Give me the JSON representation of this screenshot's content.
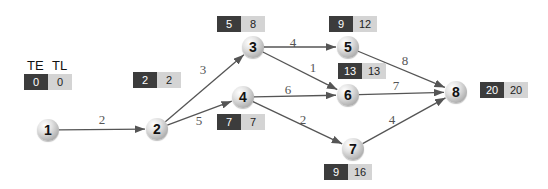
{
  "legend": {
    "te_label": "TE",
    "tl_label": "TL"
  },
  "colors": {
    "te_box": "#3c3c3c",
    "tl_box": "#d4d4d4",
    "edge": "#555555"
  },
  "nodes": [
    {
      "id": "1",
      "x": 48,
      "y": 130,
      "te": "0",
      "tl": "0",
      "bx": 24,
      "by": 74
    },
    {
      "id": "2",
      "x": 157,
      "y": 129,
      "te": "2",
      "tl": "2",
      "bx": 133,
      "by": 72
    },
    {
      "id": "3",
      "x": 253,
      "y": 47,
      "te": "5",
      "tl": "8",
      "bx": 217,
      "by": 16
    },
    {
      "id": "4",
      "x": 243,
      "y": 97,
      "te": "7",
      "tl": "7",
      "bx": 217,
      "by": 114
    },
    {
      "id": "5",
      "x": 348,
      "y": 47,
      "te": "9",
      "tl": "12",
      "bx": 329,
      "by": 16
    },
    {
      "id": "6",
      "x": 348,
      "y": 95,
      "te": "13",
      "tl": "13",
      "bx": 338,
      "by": 63
    },
    {
      "id": "7",
      "x": 353,
      "y": 149,
      "te": "9",
      "tl": "16",
      "bx": 324,
      "by": 164
    },
    {
      "id": "8",
      "x": 456,
      "y": 92,
      "te": "20",
      "tl": "20",
      "bx": 480,
      "by": 82
    }
  ],
  "edges": [
    {
      "from": "1",
      "to": "2",
      "weight": "2",
      "lx": 102,
      "ly": 120
    },
    {
      "from": "2",
      "to": "3",
      "weight": "3",
      "lx": 203,
      "ly": 70
    },
    {
      "from": "2",
      "to": "4",
      "weight": "5",
      "lx": 199,
      "ly": 121
    },
    {
      "from": "3",
      "to": "5",
      "weight": "4",
      "lx": 293,
      "ly": 43
    },
    {
      "from": "3",
      "to": "6",
      "weight": "1",
      "lx": 313,
      "ly": 68
    },
    {
      "from": "4",
      "to": "6",
      "weight": "6",
      "lx": 288,
      "ly": 90
    },
    {
      "from": "4",
      "to": "7",
      "weight": "2",
      "lx": 303,
      "ly": 120
    },
    {
      "from": "5",
      "to": "8",
      "weight": "8",
      "lx": 405,
      "ly": 61
    },
    {
      "from": "6",
      "to": "8",
      "weight": "7",
      "lx": 396,
      "ly": 86
    },
    {
      "from": "7",
      "to": "8",
      "weight": "4",
      "lx": 392,
      "ly": 120
    }
  ]
}
